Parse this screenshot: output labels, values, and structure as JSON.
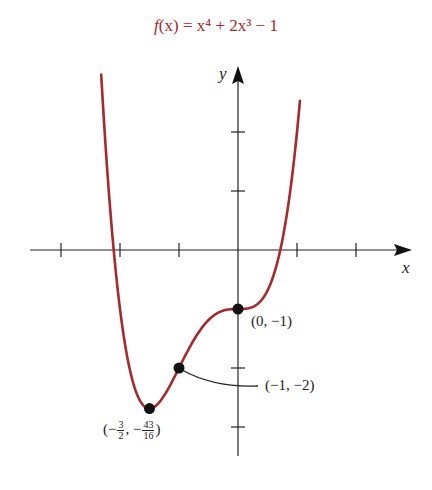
{
  "chart_data": {
    "type": "line",
    "title": "f(x) = x⁴ + 2x³ − 1",
    "function": "x^4 + 2x^3 - 1",
    "xlabel": "x",
    "ylabel": "y",
    "xlim": [
      -3.5,
      2.9
    ],
    "ylim": [
      -3.5,
      3.1
    ],
    "x_ticks": [
      -3,
      -2,
      -1,
      1,
      2
    ],
    "y_ticks": [
      -3,
      -2,
      -1,
      1,
      2
    ],
    "tick_labels_shown": false,
    "grid": false,
    "series": [
      {
        "name": "f(x)",
        "color": "#a8282c",
        "x": [
          -2.45,
          -2.3,
          -2.2,
          -2.1,
          -2.0,
          -1.9,
          -1.8,
          -1.7,
          -1.6,
          -1.5,
          -1.4,
          -1.3,
          -1.2,
          -1.1,
          -1.0,
          -0.9,
          -0.8,
          -0.6,
          -0.4,
          -0.2,
          0.0,
          0.2,
          0.4,
          0.6,
          0.8,
          0.9,
          1.0,
          1.05
        ],
        "y": [
          3.62,
          2.65,
          1.13,
          0.21,
          -1.0,
          -1.69,
          -2.17,
          -2.47,
          -2.64,
          -2.69,
          -2.65,
          -2.54,
          -2.38,
          -2.2,
          -2.0,
          -1.8,
          -1.61,
          -1.3,
          -1.1,
          -1.01,
          -1.0,
          -0.98,
          -0.85,
          -0.44,
          0.43,
          1.11,
          2.0,
          2.53
        ]
      }
    ],
    "points": [
      {
        "x": 0,
        "y": -1,
        "label": "(0, −1)"
      },
      {
        "x": -1,
        "y": -2,
        "label": "(−1, −2)"
      },
      {
        "x": -1.5,
        "y": -2.6875,
        "label": "(−3/2, −43/16)"
      }
    ]
  },
  "labels": {
    "title_fx": "f",
    "title_rest": "(x) = x⁴ + 2x³ − 1",
    "x_axis": "x",
    "y_axis": "y",
    "point_a": "(0, −1)",
    "point_b": "(−1, −2)",
    "point_c_open": "(−",
    "point_c_n1": "3",
    "point_c_d1": "2",
    "point_c_mid": ", −",
    "point_c_n2": "43",
    "point_c_d2": "16",
    "point_c_close": ")"
  },
  "colors": {
    "curve": "#a8282c",
    "axis": "#222222",
    "point": "#111111"
  }
}
